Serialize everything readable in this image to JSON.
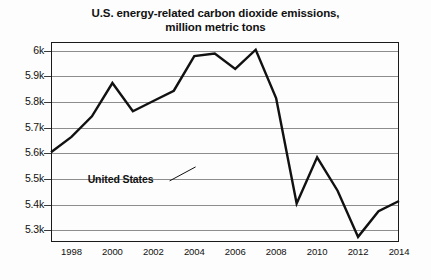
{
  "chart_data": {
    "type": "line",
    "title": "U.S. energy-related carbon dioxide emissions, million metric tons",
    "title_line1": "U.S. energy-related carbon dioxide emissions,",
    "title_line2": "million metric tons",
    "xlabel": "",
    "ylabel": "",
    "grid": true,
    "legend_position": "inline-annotation",
    "xlim": [
      1997,
      2014
    ],
    "ylim": [
      5250,
      6030
    ],
    "ytick_labels": [
      "6k",
      "5.9k",
      "5.8k",
      "5.7k",
      "5.6k",
      "5.5k",
      "5.4k",
      "5.3k"
    ],
    "ytick_values": [
      6000,
      5900,
      5800,
      5700,
      5600,
      5500,
      5400,
      5300
    ],
    "xtick_labels": [
      "1998",
      "2000",
      "2002",
      "2004",
      "2006",
      "2008",
      "2010",
      "2012",
      "2014"
    ],
    "xtick_values": [
      1998,
      2000,
      2002,
      2004,
      2006,
      2008,
      2010,
      2012,
      2014
    ],
    "series": [
      {
        "name": "United States",
        "color": "#111111",
        "x": [
          1997,
          1998,
          1999,
          2000,
          2001,
          2002,
          2003,
          2004,
          2005,
          2006,
          2007,
          2008,
          2009,
          2010,
          2011,
          2012,
          2013,
          2014
        ],
        "values": [
          5600,
          5660,
          5740,
          5870,
          5760,
          5800,
          5840,
          5975,
          5985,
          5925,
          6000,
          5810,
          5400,
          5580,
          5450,
          5270,
          5370,
          5410
        ]
      }
    ],
    "annotations": [
      {
        "text": "United States",
        "x": 2002.6,
        "y": 5492
      }
    ]
  }
}
